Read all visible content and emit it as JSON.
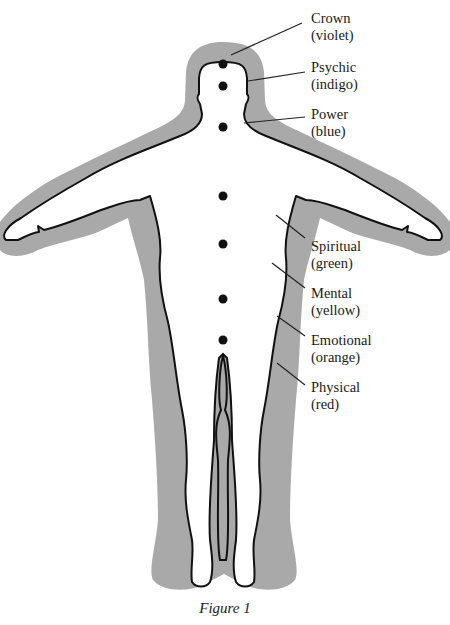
{
  "figure": {
    "caption": "Figure 1",
    "colors": {
      "aura": "#a9a9a9",
      "body_fill": "#ffffff",
      "outline": "#111111",
      "chakra_dot": "#111111",
      "leader_line": "#222222"
    }
  },
  "labels": [
    {
      "id": "crown",
      "name": "Crown",
      "color": "(violet)"
    },
    {
      "id": "psychic",
      "name": "Psychic",
      "color": "(indigo)"
    },
    {
      "id": "power",
      "name": "Power",
      "color": "(blue)"
    },
    {
      "id": "spiritual",
      "name": "Spiritual",
      "color": "(green)"
    },
    {
      "id": "mental",
      "name": "Mental",
      "color": "(yellow)"
    },
    {
      "id": "emotional",
      "name": "Emotional",
      "color": "(orange)"
    },
    {
      "id": "physical",
      "name": "Physical",
      "color": "(red)"
    }
  ],
  "chakra_points": 7
}
